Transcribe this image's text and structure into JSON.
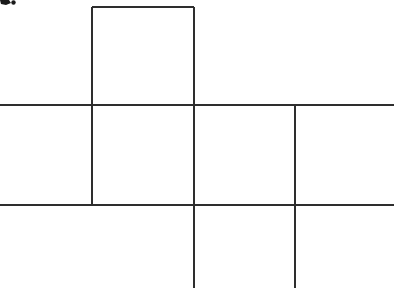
{
  "figure": {
    "background_color": "#ffffff",
    "line_color": "#2e2e2e",
    "line_width": 2,
    "canvas": {
      "width": 394,
      "height": 288
    }
  },
  "chart_data": {
    "type": "diagram",
    "xlabel": "",
    "ylabel": "",
    "xlim": [
      0,
      394
    ],
    "ylim": [
      0,
      288
    ],
    "grid": false,
    "legend": null,
    "segments": [
      {
        "name": "top-flap-top-edge",
        "orientation": "horizontal",
        "x1": 92,
        "y1": 7,
        "x2": 194,
        "y2": 7
      },
      {
        "name": "upper-horizontal-rule",
        "orientation": "horizontal",
        "x1": 0,
        "y1": 105,
        "x2": 394,
        "y2": 105
      },
      {
        "name": "lower-horizontal-rule",
        "orientation": "horizontal",
        "x1": 0,
        "y1": 205,
        "x2": 394,
        "y2": 205
      },
      {
        "name": "left-vertical-rule",
        "orientation": "vertical",
        "x1": 92,
        "y1": 7,
        "x2": 92,
        "y2": 205
      },
      {
        "name": "middle-vertical-rule",
        "orientation": "vertical",
        "x1": 194,
        "y1": 7,
        "x2": 194,
        "y2": 288
      },
      {
        "name": "right-vertical-rule",
        "orientation": "vertical",
        "x1": 295,
        "y1": 105,
        "x2": 295,
        "y2": 288
      }
    ],
    "faces": [
      {
        "name": "top-flap-face",
        "x": 92,
        "y": 7,
        "width": 102,
        "height": 98
      },
      {
        "name": "left-band-face",
        "x": 0,
        "y": 105,
        "width": 92,
        "height": 100
      },
      {
        "name": "center-band-face",
        "x": 92,
        "y": 105,
        "width": 102,
        "height": 100
      },
      {
        "name": "right-band-face",
        "x": 194,
        "y": 105,
        "width": 101,
        "height": 100
      },
      {
        "name": "far-right-face",
        "x": 295,
        "y": 105,
        "width": 99,
        "height": 100
      },
      {
        "name": "bottom-flap-face",
        "x": 194,
        "y": 205,
        "width": 101,
        "height": 83
      }
    ],
    "marks": [
      {
        "name": "top-left-ink-fragment",
        "x": 0,
        "y": 0,
        "width": 14,
        "height": 7
      }
    ]
  }
}
